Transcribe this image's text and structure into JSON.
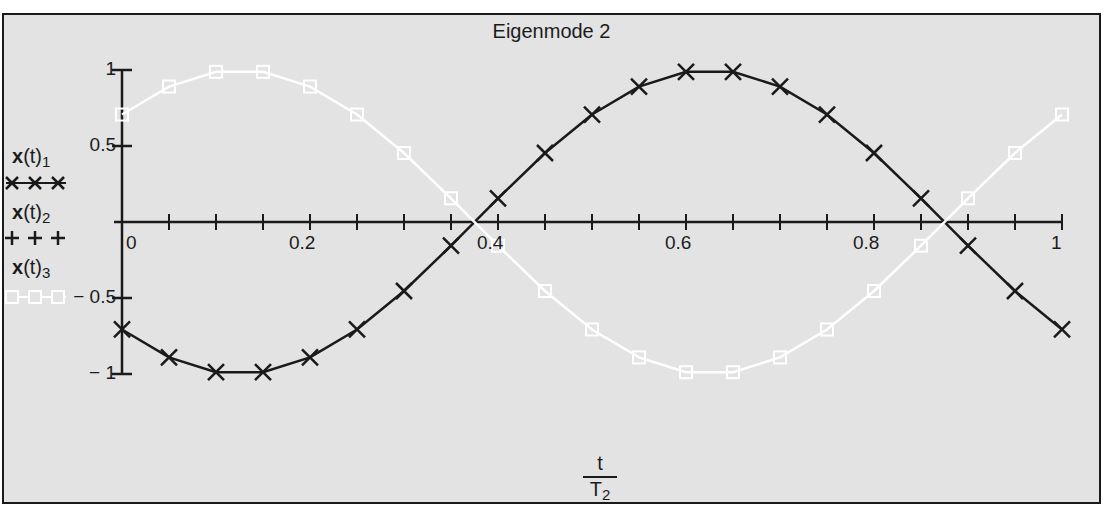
{
  "chart_data": {
    "type": "line",
    "title": "Eigenmode 2",
    "xlabel": "t / T2",
    "xlabel_numerator": "t",
    "xlabel_denominator": "T",
    "xlabel_denominator_sub": "2",
    "ylabel": "",
    "xlim": [
      0,
      1
    ],
    "ylim": [
      -1,
      1
    ],
    "x_ticks": [
      0,
      0.2,
      0.4,
      0.6,
      0.8,
      1
    ],
    "x_tick_labels": [
      "0",
      "0.2",
      "0.4",
      "0.6",
      "0.8",
      "1"
    ],
    "x_minor_step": 0.05,
    "y_ticks": [
      1,
      0.5,
      -0.5,
      -1
    ],
    "y_tick_labels": [
      "1",
      "0.5",
      "− 0.5",
      "− 1"
    ],
    "grid": false,
    "legend_position": "left",
    "x": [
      0,
      0.05,
      0.1,
      0.15,
      0.2,
      0.25,
      0.3,
      0.35,
      0.4,
      0.45,
      0.5,
      0.55,
      0.6,
      0.65,
      0.7,
      0.75,
      0.8,
      0.85,
      0.9,
      0.95,
      1
    ],
    "series": [
      {
        "name": "x(t)1",
        "label_main": "x",
        "label_arg": "(t)",
        "label_sub": "1",
        "marker": "x",
        "color": "#1a1a1a",
        "values": [
          -0.707,
          -0.891,
          -0.988,
          -0.988,
          -0.891,
          -0.707,
          -0.454,
          -0.156,
          0.156,
          0.454,
          0.707,
          0.891,
          0.988,
          0.988,
          0.891,
          0.707,
          0.454,
          0.156,
          -0.156,
          -0.454,
          -0.707
        ]
      },
      {
        "name": "x(t)2",
        "label_main": "x",
        "label_arg": "(t)",
        "label_sub": "2",
        "marker": "+",
        "color": "#1a1a1a",
        "values": [
          0,
          0,
          0,
          0,
          0,
          0,
          0,
          0,
          0,
          0,
          0,
          0,
          0,
          0,
          0,
          0,
          0,
          0,
          0,
          0,
          0
        ]
      },
      {
        "name": "x(t)3",
        "label_main": "x",
        "label_arg": "(t)",
        "label_sub": "3",
        "marker": "square",
        "color": "#ffffff",
        "values": [
          0.707,
          0.891,
          0.988,
          0.988,
          0.891,
          0.707,
          0.454,
          0.156,
          -0.156,
          -0.454,
          -0.707,
          -0.891,
          -0.988,
          -0.988,
          -0.891,
          -0.707,
          -0.454,
          -0.156,
          0.156,
          0.454,
          0.707
        ]
      }
    ]
  },
  "colors": {
    "background": "#e3e3e3",
    "axis": "#1a1a1a",
    "series1": "#1a1a1a",
    "series3": "#ffffff"
  }
}
